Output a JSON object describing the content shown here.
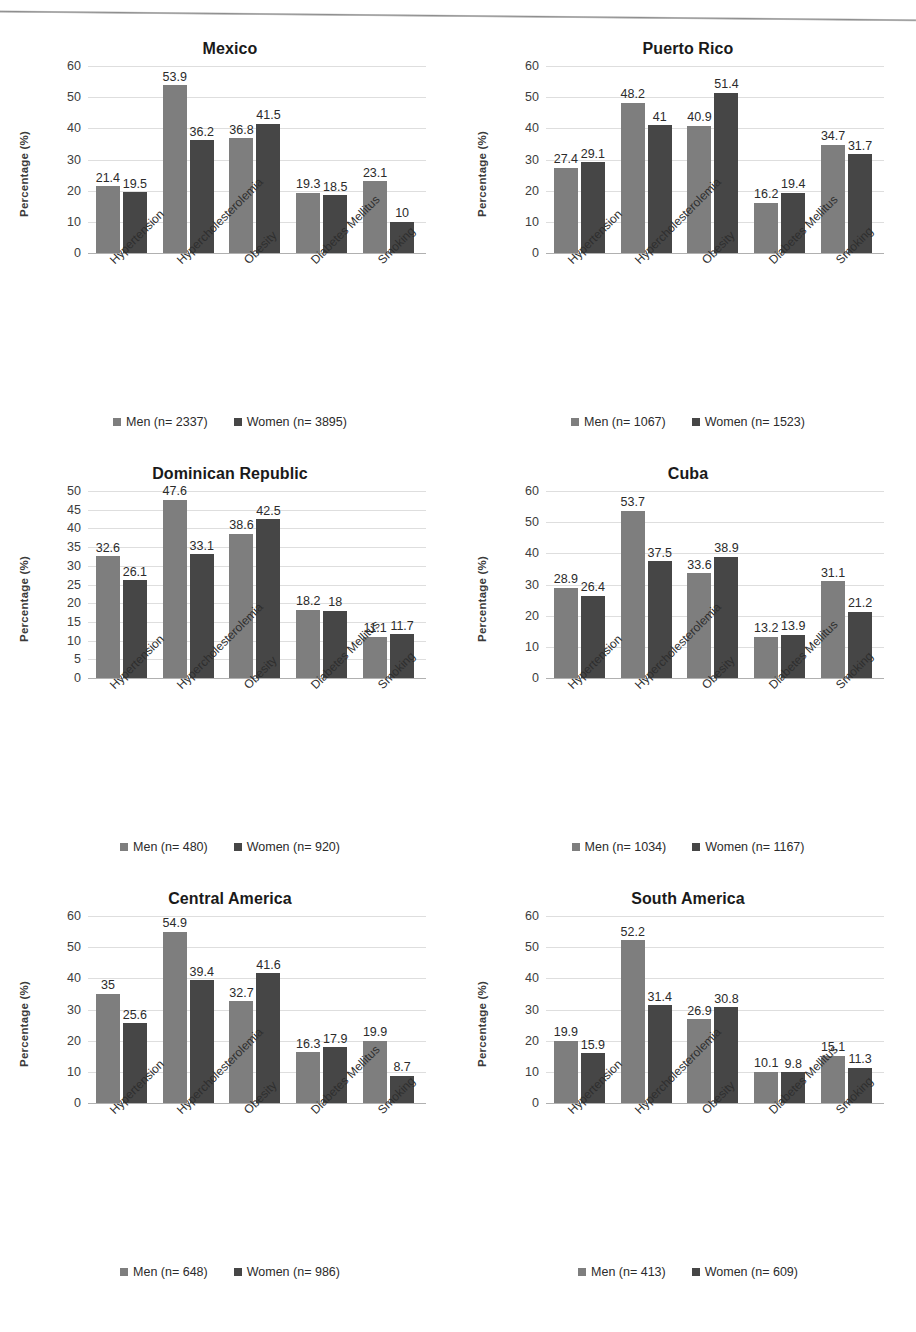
{
  "figure": {
    "categories": [
      "Hypertension",
      "Hypercholesterolemia",
      "Obesity",
      "Diabetes Mellitus",
      "Smoking"
    ],
    "ylabel": "Percentage (%)",
    "series_names": [
      "Men",
      "Women"
    ],
    "colors": {
      "men": "#7e7e7e",
      "women": "#464646"
    }
  },
  "chart_data": [
    {
      "type": "bar",
      "title": "Mexico",
      "xlabel": "",
      "ylabel": "Percentage (%)",
      "categories": [
        "Hypertension",
        "Hypercholesterolemia",
        "Obesity",
        "Diabetes Mellitus",
        "Smoking"
      ],
      "series": [
        {
          "name": "Men (n= 2337)",
          "values": [
            21.4,
            53.9,
            36.8,
            19.3,
            23.1
          ]
        },
        {
          "name": "Women (n= 3895)",
          "values": [
            19.5,
            36.2,
            41.5,
            18.5,
            10
          ]
        }
      ],
      "yticks": [
        0,
        10,
        20,
        30,
        40,
        50,
        60
      ],
      "ylim": [
        0,
        60
      ],
      "grid": true,
      "legend": [
        "Men (n= 2337)",
        "Women (n= 3895)"
      ],
      "legend_position": "bottom"
    },
    {
      "type": "bar",
      "title": "Puerto Rico",
      "xlabel": "",
      "ylabel": "Percentage (%)",
      "categories": [
        "Hypertension",
        "Hypercholesterolemia",
        "Obesity",
        "Diabetes Mellitus",
        "Smoking"
      ],
      "series": [
        {
          "name": "Men (n= 1067)",
          "values": [
            27.4,
            48.2,
            40.9,
            16.2,
            34.7
          ]
        },
        {
          "name": "Women (n= 1523)",
          "values": [
            29.1,
            41,
            51.4,
            19.4,
            31.7
          ]
        }
      ],
      "yticks": [
        0,
        10,
        20,
        30,
        40,
        50,
        60
      ],
      "ylim": [
        0,
        60
      ],
      "grid": true,
      "legend": [
        "Men (n= 1067)",
        "Women (n= 1523)"
      ],
      "legend_position": "bottom"
    },
    {
      "type": "bar",
      "title": "Dominican Republic",
      "xlabel": "",
      "ylabel": "Percentage (%)",
      "categories": [
        "Hypertension",
        "Hypercholesterolemia",
        "Obesity",
        "Diabetes Mellitus",
        "Smoking"
      ],
      "series": [
        {
          "name": "Men (n= 480)",
          "values": [
            32.6,
            47.6,
            38.6,
            18.2,
            11.1
          ]
        },
        {
          "name": "Women (n= 920)",
          "values": [
            26.1,
            33.1,
            42.5,
            18,
            11.7
          ]
        }
      ],
      "yticks": [
        0,
        5,
        10,
        15,
        20,
        25,
        30,
        35,
        40,
        45,
        50
      ],
      "ylim": [
        0,
        50
      ],
      "grid": true,
      "legend": [
        "Men (n= 480)",
        "Women (n= 920)"
      ],
      "legend_position": "bottom"
    },
    {
      "type": "bar",
      "title": "Cuba",
      "xlabel": "",
      "ylabel": "Percentage (%)",
      "categories": [
        "Hypertension",
        "Hypercholesterolemia",
        "Obesity",
        "Diabetes Mellitus",
        "Smoking"
      ],
      "series": [
        {
          "name": "Men (n= 1034)",
          "values": [
            28.9,
            53.7,
            33.6,
            13.2,
            31.1
          ]
        },
        {
          "name": "Women (n= 1167)",
          "values": [
            26.4,
            37.5,
            38.9,
            13.9,
            21.2
          ]
        }
      ],
      "yticks": [
        0,
        10,
        20,
        30,
        40,
        50,
        60
      ],
      "ylim": [
        0,
        60
      ],
      "grid": true,
      "legend": [
        "Men (n= 1034)",
        "Women (n= 1167)"
      ],
      "legend_position": "bottom"
    },
    {
      "type": "bar",
      "title": "Central America",
      "xlabel": "",
      "ylabel": "Percentage (%)",
      "categories": [
        "Hypertension",
        "Hypercholesterolemia",
        "Obesity",
        "Diabetes Mellitus",
        "Smoking"
      ],
      "series": [
        {
          "name": "Men (n= 648)",
          "values": [
            35,
            54.9,
            32.7,
            16.3,
            19.9
          ]
        },
        {
          "name": "Women (n= 986)",
          "values": [
            25.6,
            39.4,
            41.6,
            17.9,
            8.7
          ]
        }
      ],
      "yticks": [
        0,
        10,
        20,
        30,
        40,
        50,
        60
      ],
      "ylim": [
        0,
        60
      ],
      "grid": true,
      "legend": [
        "Men (n= 648)",
        "Women (n= 986)"
      ],
      "legend_position": "bottom"
    },
    {
      "type": "bar",
      "title": "South America",
      "xlabel": "",
      "ylabel": "Percentage (%)",
      "categories": [
        "Hypertension",
        "Hypercholesterolemia",
        "Obesity",
        "Diabetes Mellitus",
        "Smoking"
      ],
      "series": [
        {
          "name": "Men (n= 413)",
          "values": [
            19.9,
            52.2,
            26.9,
            10.1,
            15.1
          ]
        },
        {
          "name": "Women (n= 609)",
          "values": [
            15.9,
            31.4,
            30.8,
            9.8,
            11.3
          ]
        }
      ],
      "yticks": [
        0,
        10,
        20,
        30,
        40,
        50,
        60
      ],
      "ylim": [
        0,
        60
      ],
      "grid": true,
      "legend": [
        "Men (n= 413)",
        "Women (n= 609)"
      ],
      "legend_position": "bottom"
    }
  ]
}
